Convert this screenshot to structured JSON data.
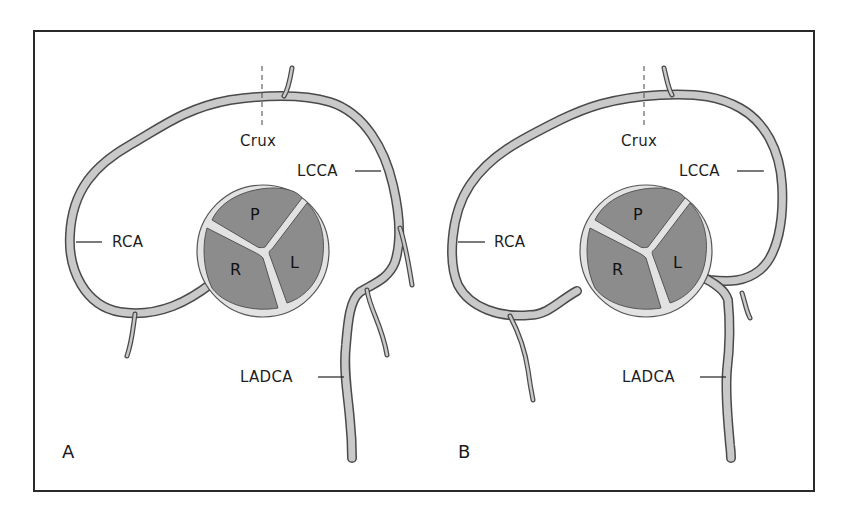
{
  "figure": {
    "type": "anatomical-diagram",
    "colors": {
      "frame": "#2a2a2a",
      "vessel_fill": "#c9c9c9",
      "vessel_outline": "#4a4a4a",
      "leaflet_fill": "#8c8c8c",
      "annulus_fill": "#e2e2e2",
      "text": "#1e1e1e"
    },
    "panels": [
      {
        "letter": "A",
        "labels": {
          "crux": "Crux",
          "lcca": "LCCA",
          "rca": "RCA",
          "ladca": "LADCA"
        },
        "valve": {
          "cusps": [
            "P",
            "R",
            "L"
          ]
        }
      },
      {
        "letter": "B",
        "labels": {
          "crux": "Crux",
          "lcca": "LCCA",
          "rca": "RCA",
          "ladca": "LADCA"
        },
        "valve": {
          "cusps": [
            "P",
            "R",
            "L"
          ]
        }
      }
    ]
  }
}
